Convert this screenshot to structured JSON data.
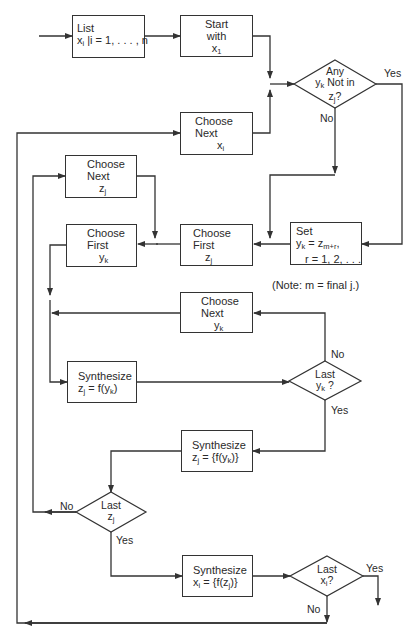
{
  "diagram": {
    "type": "flowchart",
    "nodes": {
      "list": {
        "line1": "List",
        "line2_var": "x",
        "line2_sub": "i",
        "line2_rest": " |i = 1, . . . , n"
      },
      "start": {
        "line1": "Start",
        "line2": "with",
        "line3_var": "x",
        "line3_sub": "1"
      },
      "choose_next_x": {
        "line1": "Choose",
        "line2": "Next",
        "line3_var": "x",
        "line3_sub": "i"
      },
      "any_yk": {
        "line1": "Any",
        "line2_var": "y",
        "line2_sub": "k",
        "line2_rest": " Not in",
        "line3_var": "z",
        "line3_sub": "j",
        "line3_rest": "?"
      },
      "choose_next_z": {
        "line1": "Choose",
        "line2": "Next",
        "line3_var": "z",
        "line3_sub": "j"
      },
      "choose_first_y": {
        "line1": "Choose",
        "line2": "First",
        "line3_var": "y",
        "line3_sub": "k"
      },
      "choose_first_z": {
        "line1": "Choose",
        "line2": "First",
        "line3_var": "z",
        "line3_sub": "j"
      },
      "set": {
        "line1": "Set",
        "line2_var": "y",
        "line2_sub": "k",
        "line2_eq": " = z",
        "line2_sub2": "m+r",
        "line2_tail": ",",
        "line3": "r = 1, 2, . . ."
      },
      "note": "(Note: m = final j.)",
      "choose_next_y": {
        "line1": "Choose",
        "line2": "Next",
        "line3_var": "y",
        "line3_sub": "k"
      },
      "synth_z": {
        "line1": "Synthesize",
        "line2_var": "z",
        "line2_sub": "j",
        "line2_mid": " = f(y",
        "line2_sub2": "k",
        "line2_end": ")"
      },
      "last_yk": {
        "line1": "Last",
        "line2_var": "y",
        "line2_sub": "k",
        "line2_rest": " ?"
      },
      "synth_z_set": {
        "line1": "Synthesize",
        "line2_var": "z",
        "line2_sub": "j",
        "line2_mid": " =  {f(y",
        "line2_sub2": "k",
        "line2_end": ")}"
      },
      "last_zj": {
        "line1": "Last",
        "line2_var": "z",
        "line2_sub": "j"
      },
      "synth_x": {
        "line1": "Synthesize",
        "line2_var": "x",
        "line2_sub": "i",
        "line2_mid": " =  {f(z",
        "line2_sub2": "j",
        "line2_end": ")}"
      },
      "last_xi": {
        "line1": "Last",
        "line2_var": "x",
        "line2_sub": "i",
        "line2_rest": "?"
      }
    },
    "edge_labels": {
      "any_yes": "Yes",
      "any_no": "No",
      "last_yk_no": "No",
      "last_yk_yes": "Yes",
      "last_zj_no": "No",
      "last_zj_yes": "Yes",
      "last_xi_yes": "Yes",
      "last_xi_no": "No"
    },
    "colors": {
      "line": "#333333",
      "text": "#2a2a2a",
      "background": "#ffffff"
    }
  }
}
